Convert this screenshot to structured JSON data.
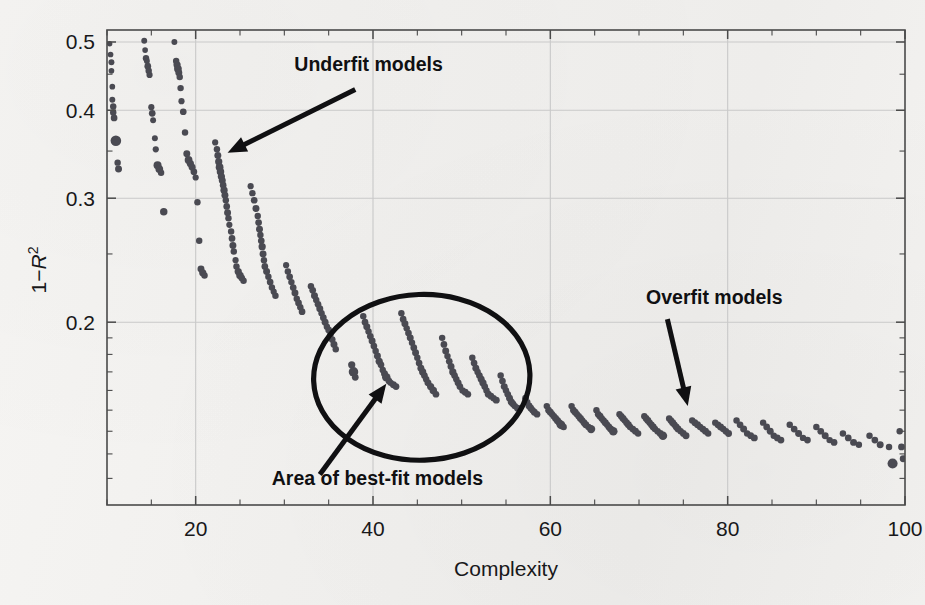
{
  "chart_data": {
    "type": "scatter",
    "title": "",
    "xlabel": "Complexity",
    "ylabel": "1−R²",
    "ylabel_plain": "1-R2",
    "xlim": [
      10,
      100
    ],
    "ylim": [
      0.11,
      0.52
    ],
    "yscale": "log",
    "xscale": "linear",
    "grid": true,
    "legend": "none",
    "xticks": [
      20,
      40,
      60,
      80,
      100
    ],
    "xtick_labels": [
      "20",
      "40",
      "60",
      "80",
      "100"
    ],
    "yticks": [
      0.2,
      0.3,
      0.4,
      0.5
    ],
    "ytick_labels": [
      "0.2",
      "0.3",
      "0.4",
      "0.5"
    ],
    "marker_color": "#4a4a52",
    "annotations": [
      {
        "name": "underfit",
        "text": "Underfit models",
        "text_x": 39.5,
        "text_y": 0.455,
        "arrow_from_x": 38.0,
        "arrow_from_y": 0.428,
        "arrow_to_x": 23.6,
        "arrow_to_y": 0.348
      },
      {
        "name": "overfit",
        "text": "Overfit models",
        "text_x": 78.5,
        "text_y": 0.212,
        "arrow_from_x": 73.2,
        "arrow_from_y": 0.202,
        "arrow_to_x": 75.5,
        "arrow_to_y": 0.152
      },
      {
        "name": "best-fit",
        "text": "Area of best-fit models",
        "text_x": 40.5,
        "text_y": 0.1175,
        "arrow_from_x": 34.0,
        "arrow_from_y": 0.1215,
        "arrow_to_x": 41.5,
        "arrow_to_y": 0.1635
      }
    ],
    "highlight_region": {
      "name": "area-of-best-fit-models",
      "shape": "ellipse",
      "center_x": 45.5,
      "center_y": 0.167,
      "radius_x": 12.2,
      "radius_y_frac": 0.052
    },
    "points": [
      [
        10.3,
        0.497,
        4.2
      ],
      [
        10.4,
        0.48,
        4.4
      ],
      [
        10.5,
        0.468,
        4.6
      ],
      [
        10.5,
        0.455,
        4.4
      ],
      [
        10.6,
        0.432,
        4.4
      ],
      [
        10.6,
        0.414,
        4.6
      ],
      [
        10.7,
        0.405,
        5.0
      ],
      [
        10.7,
        0.397,
        5.0
      ],
      [
        10.8,
        0.39,
        5.2
      ],
      [
        11.0,
        0.362,
        8.2
      ],
      [
        11.2,
        0.337,
        5.0
      ],
      [
        11.3,
        0.33,
        5.4
      ],
      [
        14.2,
        0.502,
        4.6
      ],
      [
        14.3,
        0.487,
        4.4
      ],
      [
        14.4,
        0.474,
        5.0
      ],
      [
        14.5,
        0.47,
        4.6
      ],
      [
        14.6,
        0.462,
        5.2
      ],
      [
        14.7,
        0.455,
        5.0
      ],
      [
        14.8,
        0.449,
        4.8
      ],
      [
        15.0,
        0.404,
        4.8
      ],
      [
        15.1,
        0.396,
        5.2
      ],
      [
        15.2,
        0.387,
        4.6
      ],
      [
        15.4,
        0.365,
        4.6
      ],
      [
        15.5,
        0.352,
        4.8
      ],
      [
        15.7,
        0.334,
        6.2
      ],
      [
        15.9,
        0.33,
        6.0
      ],
      [
        16.1,
        0.326,
        5.0
      ],
      [
        16.4,
        0.287,
        5.8
      ],
      [
        17.6,
        0.5,
        4.6
      ],
      [
        17.8,
        0.47,
        5.0
      ],
      [
        17.9,
        0.464,
        5.6
      ],
      [
        18.0,
        0.458,
        6.0
      ],
      [
        18.1,
        0.452,
        5.4
      ],
      [
        18.2,
        0.446,
        5.0
      ],
      [
        18.3,
        0.43,
        5.0
      ],
      [
        18.4,
        0.412,
        4.8
      ],
      [
        18.6,
        0.398,
        5.2
      ],
      [
        18.8,
        0.372,
        5.0
      ],
      [
        19.0,
        0.347,
        5.4
      ],
      [
        19.2,
        0.34,
        6.0
      ],
      [
        19.4,
        0.336,
        5.6
      ],
      [
        19.6,
        0.332,
        5.4
      ],
      [
        19.8,
        0.327,
        5.2
      ],
      [
        20.0,
        0.321,
        4.8
      ],
      [
        20.2,
        0.296,
        5.0
      ],
      [
        20.4,
        0.261,
        5.0
      ],
      [
        20.6,
        0.238,
        5.4
      ],
      [
        20.8,
        0.235,
        5.6
      ],
      [
        21.0,
        0.233,
        5.0
      ],
      [
        22.2,
        0.36,
        4.8
      ],
      [
        22.4,
        0.352,
        5.0
      ],
      [
        22.5,
        0.345,
        5.4
      ],
      [
        22.6,
        0.338,
        5.6
      ],
      [
        22.7,
        0.332,
        6.0
      ],
      [
        22.8,
        0.327,
        5.8
      ],
      [
        22.9,
        0.322,
        5.6
      ],
      [
        23.0,
        0.318,
        5.4
      ],
      [
        23.1,
        0.313,
        5.2
      ],
      [
        23.2,
        0.308,
        5.6
      ],
      [
        23.3,
        0.303,
        5.4
      ],
      [
        23.4,
        0.298,
        5.0
      ],
      [
        23.5,
        0.292,
        5.2
      ],
      [
        23.6,
        0.286,
        5.4
      ],
      [
        23.7,
        0.281,
        5.0
      ],
      [
        23.8,
        0.275,
        4.8
      ],
      [
        24.0,
        0.269,
        5.0
      ],
      [
        24.1,
        0.263,
        5.2
      ],
      [
        24.2,
        0.257,
        5.4
      ],
      [
        24.3,
        0.252,
        5.0
      ],
      [
        24.5,
        0.245,
        4.8
      ],
      [
        24.6,
        0.24,
        5.0
      ],
      [
        24.8,
        0.236,
        5.6
      ],
      [
        25.0,
        0.233,
        5.8
      ],
      [
        25.2,
        0.231,
        5.2
      ],
      [
        25.4,
        0.229,
        5.0
      ],
      [
        26.2,
        0.312,
        4.8
      ],
      [
        26.4,
        0.305,
        5.0
      ],
      [
        26.6,
        0.298,
        5.2
      ],
      [
        26.8,
        0.29,
        5.4
      ],
      [
        27.0,
        0.283,
        5.0
      ],
      [
        27.1,
        0.277,
        5.2
      ],
      [
        27.2,
        0.271,
        5.4
      ],
      [
        27.3,
        0.266,
        5.0
      ],
      [
        27.4,
        0.261,
        5.2
      ],
      [
        27.5,
        0.256,
        5.6
      ],
      [
        27.6,
        0.25,
        5.4
      ],
      [
        27.7,
        0.245,
        5.0
      ],
      [
        27.8,
        0.24,
        5.2
      ],
      [
        28.0,
        0.236,
        5.4
      ],
      [
        28.2,
        0.232,
        5.0
      ],
      [
        28.4,
        0.228,
        5.2
      ],
      [
        28.6,
        0.224,
        5.0
      ],
      [
        28.8,
        0.221,
        4.8
      ],
      [
        29.0,
        0.218,
        5.0
      ],
      [
        30.2,
        0.241,
        4.8
      ],
      [
        30.4,
        0.236,
        5.0
      ],
      [
        30.6,
        0.232,
        5.2
      ],
      [
        30.8,
        0.228,
        5.0
      ],
      [
        31.0,
        0.224,
        5.2
      ],
      [
        31.2,
        0.22,
        5.4
      ],
      [
        31.4,
        0.216,
        5.0
      ],
      [
        31.6,
        0.213,
        5.2
      ],
      [
        31.8,
        0.21,
        5.0
      ],
      [
        32.0,
        0.207,
        5.2
      ],
      [
        33.0,
        0.225,
        5.0
      ],
      [
        33.2,
        0.222,
        5.2
      ],
      [
        33.4,
        0.218,
        5.4
      ],
      [
        33.6,
        0.215,
        5.0
      ],
      [
        33.8,
        0.212,
        5.2
      ],
      [
        34.0,
        0.209,
        5.4
      ],
      [
        34.2,
        0.206,
        5.0
      ],
      [
        34.4,
        0.203,
        5.2
      ],
      [
        34.6,
        0.2,
        5.4
      ],
      [
        34.8,
        0.197,
        5.0
      ],
      [
        35.0,
        0.195,
        5.2
      ],
      [
        35.2,
        0.192,
        5.0
      ],
      [
        35.4,
        0.189,
        5.2
      ],
      [
        35.6,
        0.186,
        5.4
      ],
      [
        35.8,
        0.183,
        5.0
      ],
      [
        37.6,
        0.174,
        5.6
      ],
      [
        37.8,
        0.17,
        7.4
      ],
      [
        38.0,
        0.167,
        5.2
      ],
      [
        38.9,
        0.204,
        5.0
      ],
      [
        39.1,
        0.2,
        5.2
      ],
      [
        39.3,
        0.197,
        5.4
      ],
      [
        39.5,
        0.194,
        5.0
      ],
      [
        39.7,
        0.191,
        5.2
      ],
      [
        39.9,
        0.188,
        5.4
      ],
      [
        40.1,
        0.185,
        5.2
      ],
      [
        40.3,
        0.182,
        5.0
      ],
      [
        40.5,
        0.179,
        5.4
      ],
      [
        40.7,
        0.176,
        5.6
      ],
      [
        40.9,
        0.174,
        5.2
      ],
      [
        41.1,
        0.171,
        5.0
      ],
      [
        41.3,
        0.169,
        5.4
      ],
      [
        41.5,
        0.167,
        6.6
      ],
      [
        41.8,
        0.165,
        5.2
      ],
      [
        42.0,
        0.164,
        5.0
      ],
      [
        42.3,
        0.163,
        5.4
      ],
      [
        42.6,
        0.162,
        5.2
      ],
      [
        43.2,
        0.206,
        5.0
      ],
      [
        43.4,
        0.202,
        5.2
      ],
      [
        43.6,
        0.199,
        5.4
      ],
      [
        43.8,
        0.196,
        5.0
      ],
      [
        44.0,
        0.193,
        5.2
      ],
      [
        44.2,
        0.19,
        5.4
      ],
      [
        44.4,
        0.187,
        5.0
      ],
      [
        44.6,
        0.184,
        5.2
      ],
      [
        44.8,
        0.181,
        5.4
      ],
      [
        45.0,
        0.178,
        5.0
      ],
      [
        45.2,
        0.175,
        5.2
      ],
      [
        45.4,
        0.172,
        5.4
      ],
      [
        45.6,
        0.17,
        5.6
      ],
      [
        45.8,
        0.168,
        5.2
      ],
      [
        46.0,
        0.166,
        5.0
      ],
      [
        46.2,
        0.164,
        5.4
      ],
      [
        46.5,
        0.162,
        5.6
      ],
      [
        46.8,
        0.16,
        5.8
      ],
      [
        47.1,
        0.158,
        5.2
      ],
      [
        47.8,
        0.19,
        5.0
      ],
      [
        48.0,
        0.186,
        5.2
      ],
      [
        48.2,
        0.182,
        5.4
      ],
      [
        48.4,
        0.179,
        5.0
      ],
      [
        48.6,
        0.176,
        5.2
      ],
      [
        48.8,
        0.173,
        5.4
      ],
      [
        49.0,
        0.17,
        5.6
      ],
      [
        49.2,
        0.168,
        5.2
      ],
      [
        49.4,
        0.166,
        5.0
      ],
      [
        49.6,
        0.164,
        5.4
      ],
      [
        49.8,
        0.162,
        5.2
      ],
      [
        50.1,
        0.16,
        5.0
      ],
      [
        50.4,
        0.159,
        5.4
      ],
      [
        50.7,
        0.158,
        5.2
      ],
      [
        51.2,
        0.178,
        5.0
      ],
      [
        51.4,
        0.175,
        5.2
      ],
      [
        51.6,
        0.172,
        5.4
      ],
      [
        51.8,
        0.17,
        5.0
      ],
      [
        52.0,
        0.168,
        5.2
      ],
      [
        52.2,
        0.166,
        5.4
      ],
      [
        52.4,
        0.164,
        5.6
      ],
      [
        52.6,
        0.162,
        5.2
      ],
      [
        52.8,
        0.16,
        5.0
      ],
      [
        53.0,
        0.158,
        5.4
      ],
      [
        53.3,
        0.157,
        5.2
      ],
      [
        53.6,
        0.156,
        5.0
      ],
      [
        53.9,
        0.155,
        5.4
      ],
      [
        54.4,
        0.168,
        5.0
      ],
      [
        54.6,
        0.165,
        5.2
      ],
      [
        54.8,
        0.162,
        5.4
      ],
      [
        55.0,
        0.16,
        5.0
      ],
      [
        55.2,
        0.158,
        5.2
      ],
      [
        55.4,
        0.156,
        5.4
      ],
      [
        55.6,
        0.154,
        5.6
      ],
      [
        55.8,
        0.153,
        5.2
      ],
      [
        56.0,
        0.152,
        5.0
      ],
      [
        56.3,
        0.151,
        5.4
      ],
      [
        57.2,
        0.156,
        5.2
      ],
      [
        57.4,
        0.154,
        5.0
      ],
      [
        57.6,
        0.152,
        5.4
      ],
      [
        57.8,
        0.151,
        5.2
      ],
      [
        58.0,
        0.15,
        5.0
      ],
      [
        58.2,
        0.149,
        5.4
      ],
      [
        58.5,
        0.148,
        5.2
      ],
      [
        59.6,
        0.152,
        5.0
      ],
      [
        59.8,
        0.15,
        5.2
      ],
      [
        60.0,
        0.149,
        5.4
      ],
      [
        60.2,
        0.148,
        5.0
      ],
      [
        60.4,
        0.147,
        5.2
      ],
      [
        60.6,
        0.146,
        5.4
      ],
      [
        60.8,
        0.145,
        5.6
      ],
      [
        61.0,
        0.144,
        5.2
      ],
      [
        61.2,
        0.143,
        6.8
      ],
      [
        61.5,
        0.142,
        5.0
      ],
      [
        62.4,
        0.152,
        5.0
      ],
      [
        62.6,
        0.15,
        5.2
      ],
      [
        62.8,
        0.149,
        5.4
      ],
      [
        63.0,
        0.148,
        5.0
      ],
      [
        63.2,
        0.147,
        5.2
      ],
      [
        63.4,
        0.146,
        5.4
      ],
      [
        63.6,
        0.145,
        5.0
      ],
      [
        63.8,
        0.144,
        5.2
      ],
      [
        64.0,
        0.143,
        5.4
      ],
      [
        64.3,
        0.142,
        5.0
      ],
      [
        64.6,
        0.141,
        6.4
      ],
      [
        65.2,
        0.15,
        5.0
      ],
      [
        65.4,
        0.148,
        5.2
      ],
      [
        65.6,
        0.147,
        5.4
      ],
      [
        65.8,
        0.146,
        5.0
      ],
      [
        66.0,
        0.145,
        5.2
      ],
      [
        66.2,
        0.144,
        5.4
      ],
      [
        66.4,
        0.143,
        5.0
      ],
      [
        66.6,
        0.142,
        5.2
      ],
      [
        66.8,
        0.141,
        5.4
      ],
      [
        67.1,
        0.14,
        6.6
      ],
      [
        67.8,
        0.148,
        5.0
      ],
      [
        68.0,
        0.147,
        5.2
      ],
      [
        68.2,
        0.146,
        5.4
      ],
      [
        68.4,
        0.145,
        5.0
      ],
      [
        68.6,
        0.144,
        5.2
      ],
      [
        68.8,
        0.143,
        5.4
      ],
      [
        69.0,
        0.142,
        5.0
      ],
      [
        69.3,
        0.141,
        5.2
      ],
      [
        69.6,
        0.14,
        5.4
      ],
      [
        69.9,
        0.139,
        5.0
      ],
      [
        70.6,
        0.147,
        5.0
      ],
      [
        70.8,
        0.146,
        5.2
      ],
      [
        71.0,
        0.145,
        5.4
      ],
      [
        71.2,
        0.144,
        5.0
      ],
      [
        71.4,
        0.143,
        5.2
      ],
      [
        71.6,
        0.142,
        5.4
      ],
      [
        71.8,
        0.141,
        5.0
      ],
      [
        72.1,
        0.14,
        5.2
      ],
      [
        72.4,
        0.139,
        5.4
      ],
      [
        72.7,
        0.138,
        6.6
      ],
      [
        73.4,
        0.146,
        5.0
      ],
      [
        73.6,
        0.145,
        5.2
      ],
      [
        73.8,
        0.144,
        5.4
      ],
      [
        74.0,
        0.143,
        5.0
      ],
      [
        74.2,
        0.142,
        5.2
      ],
      [
        74.4,
        0.141,
        5.4
      ],
      [
        74.7,
        0.14,
        5.0
      ],
      [
        75.0,
        0.139,
        5.2
      ],
      [
        75.3,
        0.138,
        5.4
      ],
      [
        76.0,
        0.145,
        5.0
      ],
      [
        76.3,
        0.144,
        5.2
      ],
      [
        76.6,
        0.143,
        5.4
      ],
      [
        76.9,
        0.142,
        5.0
      ],
      [
        77.2,
        0.141,
        5.2
      ],
      [
        77.5,
        0.14,
        5.4
      ],
      [
        77.8,
        0.139,
        5.0
      ],
      [
        78.6,
        0.144,
        5.0
      ],
      [
        78.9,
        0.143,
        5.2
      ],
      [
        79.2,
        0.142,
        5.4
      ],
      [
        79.5,
        0.141,
        5.0
      ],
      [
        79.8,
        0.14,
        5.2
      ],
      [
        80.1,
        0.139,
        5.4
      ],
      [
        81.0,
        0.145,
        5.0
      ],
      [
        81.4,
        0.143,
        5.2
      ],
      [
        81.8,
        0.141,
        5.4
      ],
      [
        82.2,
        0.139,
        5.0
      ],
      [
        82.6,
        0.138,
        5.2
      ],
      [
        83.0,
        0.137,
        5.4
      ],
      [
        84.0,
        0.144,
        5.0
      ],
      [
        84.4,
        0.142,
        5.2
      ],
      [
        84.8,
        0.14,
        5.4
      ],
      [
        85.2,
        0.138,
        5.0
      ],
      [
        85.6,
        0.137,
        5.2
      ],
      [
        86.0,
        0.136,
        5.4
      ],
      [
        87.0,
        0.143,
        5.0
      ],
      [
        87.5,
        0.141,
        5.2
      ],
      [
        88.0,
        0.139,
        5.4
      ],
      [
        88.5,
        0.137,
        5.0
      ],
      [
        89.0,
        0.136,
        5.2
      ],
      [
        90.0,
        0.142,
        5.0
      ],
      [
        90.5,
        0.14,
        5.2
      ],
      [
        91.0,
        0.138,
        5.4
      ],
      [
        91.5,
        0.136,
        5.0
      ],
      [
        92.0,
        0.135,
        5.2
      ],
      [
        93.0,
        0.139,
        5.0
      ],
      [
        93.6,
        0.137,
        5.2
      ],
      [
        94.2,
        0.135,
        5.4
      ],
      [
        94.8,
        0.134,
        5.0
      ],
      [
        96.0,
        0.138,
        5.0
      ],
      [
        96.6,
        0.136,
        5.2
      ],
      [
        97.2,
        0.134,
        5.4
      ],
      [
        98.2,
        0.133,
        5.0
      ],
      [
        98.6,
        0.126,
        7.8
      ],
      [
        99.4,
        0.14,
        5.0
      ],
      [
        99.6,
        0.133,
        5.2
      ],
      [
        99.8,
        0.128,
        5.4
      ]
    ]
  }
}
